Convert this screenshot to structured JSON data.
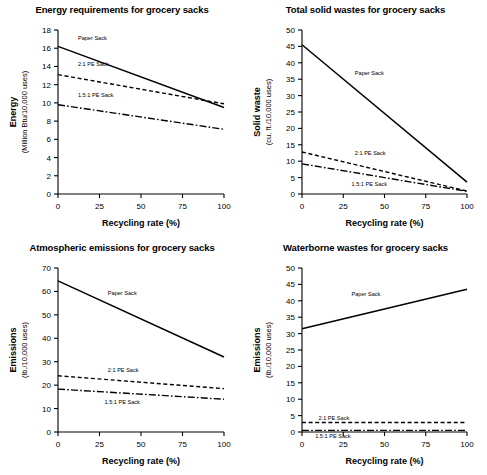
{
  "figure": {
    "layout": "2x2 grid of line charts",
    "shared_xlabel": "Recycling rate (%)",
    "shared_xticks": [
      "0",
      "25",
      "50",
      "75",
      "100"
    ]
  },
  "chart_data": [
    {
      "type": "line",
      "title": "Energy requirements for grocery sacks",
      "xlabel": "Recycling rate (%)",
      "ylabel": "Energy",
      "yunit": "(Million Btu/10,000 uses)",
      "x": [
        0,
        100
      ],
      "xlim": [
        0,
        100
      ],
      "ylim": [
        0,
        18
      ],
      "xticks": [
        0,
        25,
        50,
        75,
        100
      ],
      "yticks": [
        0,
        2,
        4,
        6,
        8,
        10,
        12,
        14,
        16,
        18
      ],
      "grid": false,
      "legend": "inline-labels",
      "series": [
        {
          "name": "Paper Sack",
          "style": "solid",
          "values": [
            16.2,
            9.5
          ],
          "label_x": 12,
          "label_y": 17.1
        },
        {
          "name": "2:1 PE Sack",
          "style": "dashed",
          "values": [
            13.1,
            9.9
          ],
          "label_x": 12,
          "label_y": 14.3
        },
        {
          "name": "1.5:1 PE Sack",
          "style": "dashdot",
          "values": [
            9.8,
            7.1
          ],
          "label_x": 12,
          "label_y": 10.9
        }
      ]
    },
    {
      "type": "line",
      "title": "Total solid wastes for grocery sacks",
      "xlabel": "Recycling rate (%)",
      "ylabel": "Solid waste",
      "yunit": "(cu. ft./10,000 uses)",
      "x": [
        0,
        100
      ],
      "xlim": [
        0,
        100
      ],
      "ylim": [
        0,
        50
      ],
      "xticks": [
        0,
        25,
        50,
        75,
        100
      ],
      "yticks": [
        0,
        5,
        10,
        15,
        20,
        25,
        30,
        35,
        40,
        45,
        50
      ],
      "grid": false,
      "legend": "inline-labels",
      "series": [
        {
          "name": "Paper Sack",
          "style": "solid",
          "values": [
            45.5,
            3.6
          ],
          "label_x": 32,
          "label_y": 37.0
        },
        {
          "name": "2:1 PE Sack",
          "style": "dashed",
          "values": [
            12.8,
            0.9
          ],
          "label_x": 32,
          "label_y": 12.6
        },
        {
          "name": "1.5:1 PE Sack",
          "style": "dashdot",
          "values": [
            9.2,
            0.8
          ],
          "label_x": 30,
          "label_y": 3.0
        }
      ]
    },
    {
      "type": "line",
      "title": "Atmospheric emissions for grocery sacks",
      "xlabel": "Recycling rate (%)",
      "ylabel": "Emissions",
      "yunit": "(lb./10,000 uses)",
      "x": [
        0,
        100
      ],
      "xlim": [
        0,
        100
      ],
      "ylim": [
        0,
        70
      ],
      "xticks": [
        0,
        25,
        50,
        75,
        100
      ],
      "yticks": [
        0,
        10,
        20,
        30,
        40,
        50,
        60,
        70
      ],
      "grid": false,
      "legend": "inline-labels",
      "series": [
        {
          "name": "Paper Sack",
          "style": "solid",
          "values": [
            64.5,
            32.0
          ],
          "label_x": 30,
          "label_y": 59.5
        },
        {
          "name": "2:1 PE Sack",
          "style": "dashed",
          "values": [
            24.0,
            18.5
          ],
          "label_x": 30,
          "label_y": 26.5
        },
        {
          "name": "1.5:1 PE Sack",
          "style": "dashdot",
          "values": [
            18.3,
            14.0
          ],
          "label_x": 28,
          "label_y": 13.0
        }
      ]
    },
    {
      "type": "line",
      "title": "Waterborne wastes for grocery sacks",
      "xlabel": "Recycling rate (%)",
      "ylabel": "Emissions",
      "yunit": "(lb./10,000 uses)",
      "x": [
        0,
        100
      ],
      "xlim": [
        0,
        100
      ],
      "ylim": [
        0,
        50
      ],
      "xticks": [
        0,
        25,
        50,
        75,
        100
      ],
      "yticks": [
        0,
        5,
        10,
        15,
        20,
        25,
        30,
        35,
        40,
        45,
        50
      ],
      "grid": false,
      "legend": "inline-labels",
      "series": [
        {
          "name": "Paper Sack",
          "style": "solid",
          "values": [
            31.5,
            43.5
          ],
          "label_x": 30,
          "label_y": 42.0
        },
        {
          "name": "2:1 PE Sack",
          "style": "dashed",
          "values": [
            2.9,
            2.9
          ],
          "label_x": 10,
          "label_y": 4.4
        },
        {
          "name": "1.5:1 PE Sack",
          "style": "dashdot",
          "values": [
            0.5,
            0.5
          ],
          "label_x": 8,
          "label_y": -1.3
        }
      ]
    }
  ]
}
